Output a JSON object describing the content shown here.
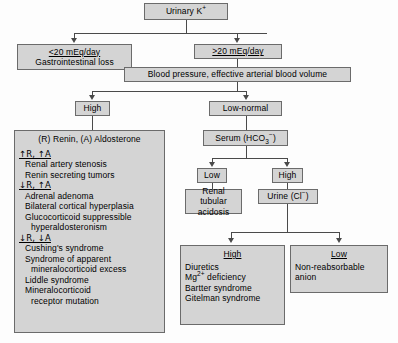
{
  "diagram": {
    "root": "Urinary K",
    "root_sup": "+",
    "nodes": {
      "low_excretion": {
        "line1": "<20 mEq/day",
        "line2": "Gastrointestinal loss"
      },
      "high_excretion": {
        "label": ">20 mEq/day"
      },
      "bp_volume": {
        "label": "Blood pressure, effective arterial blood volume"
      },
      "bp_high": {
        "label": "High"
      },
      "bp_low_normal": {
        "label": "Low-normal"
      },
      "renin_panel": {
        "title": "(R) Renin, (A) Aldosterone",
        "groups": [
          {
            "heading": "↑R, ↑A",
            "items": [
              "Renal artery stenosis",
              "Renin secreting tumors"
            ]
          },
          {
            "heading": "↓R, ↑A",
            "items": [
              "Adrenal adenoma",
              "Bilateral cortical hyperplasia",
              "Glucocorticoid suppressible",
              "hyperaldosteronism"
            ]
          },
          {
            "heading": "↓R, ↓A",
            "items": [
              "Cushing's syndrome",
              "Syndrome of apparent",
              "mineralocorticoid excess",
              "Liddle syndrome",
              "Mineralocorticoid",
              "receptor mutation"
            ]
          }
        ]
      },
      "serum_hco3": {
        "prefix": "Serum (HCO",
        "sub": "3",
        "sup": "−",
        "suffix": ")"
      },
      "hco3_low": {
        "label": "Low"
      },
      "hco3_high": {
        "label": "High"
      },
      "rta": {
        "line1": "Renal tubular",
        "line2": "acidosis"
      },
      "urine_cl": {
        "prefix": "Urine (Cl",
        "sup": "−",
        "suffix": ")"
      },
      "cl_high": {
        "heading": "High",
        "items": [
          "Diuretics",
          "Mg2+ deficiency",
          "Bartter syndrome",
          "Gitelman syndrome"
        ],
        "mg_prefix": "Mg",
        "mg_sup": "2+",
        "mg_suffix": " deficiency"
      },
      "cl_low": {
        "heading": "Low",
        "line1": "Non-reabsorbable",
        "line2": "anion"
      }
    },
    "colors": {
      "box_fill": "#d4d4d4",
      "box_border": "#6b6b6b",
      "connector": "#4a4a4a",
      "text": "#000000"
    }
  }
}
